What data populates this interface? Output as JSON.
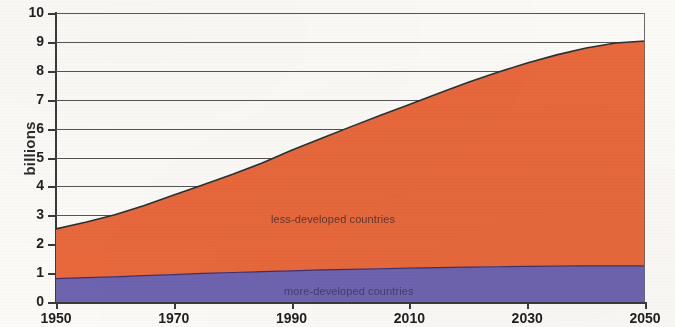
{
  "chart_data": {
    "type": "area",
    "stacked": true,
    "title": "",
    "xlabel": "",
    "ylabel": "billions",
    "xlim": [
      1950,
      2050
    ],
    "ylim": [
      0,
      10
    ],
    "grid": true,
    "legend_position": "in-plot-annotations",
    "x_tick_labels": [
      "1950",
      "1970",
      "1990",
      "2010",
      "2030",
      "2050"
    ],
    "x_ticks": [
      1950,
      1970,
      1990,
      2010,
      2030,
      2050
    ],
    "y_tick_labels": [
      "0",
      "1",
      "2",
      "3",
      "4",
      "5",
      "6",
      "7",
      "8",
      "9",
      "10"
    ],
    "y_ticks": [
      0,
      1,
      2,
      3,
      4,
      5,
      6,
      7,
      8,
      9,
      10
    ],
    "x": [
      1950,
      1955,
      1960,
      1965,
      1970,
      1975,
      1980,
      1985,
      1990,
      1995,
      2000,
      2005,
      2010,
      2015,
      2020,
      2025,
      2030,
      2035,
      2040,
      2045,
      2050
    ],
    "series": [
      {
        "name": "more-developed countries",
        "color": "#6E63AF",
        "values": [
          0.81,
          0.84,
          0.87,
          0.91,
          0.95,
          0.99,
          1.02,
          1.05,
          1.08,
          1.11,
          1.13,
          1.15,
          1.17,
          1.19,
          1.21,
          1.22,
          1.23,
          1.24,
          1.25,
          1.25,
          1.25
        ]
      },
      {
        "name": "less-developed countries",
        "color": "#E8683C",
        "values": [
          1.72,
          1.92,
          2.15,
          2.43,
          2.75,
          3.07,
          3.4,
          3.76,
          4.17,
          4.55,
          4.93,
          5.3,
          5.66,
          6.03,
          6.39,
          6.73,
          7.04,
          7.31,
          7.54,
          7.71,
          7.78
        ]
      }
    ],
    "totals": [
      2.53,
      2.76,
      3.02,
      3.34,
      3.7,
      4.06,
      4.42,
      4.81,
      5.25,
      5.66,
      6.06,
      6.45,
      6.83,
      7.22,
      7.6,
      7.95,
      8.27,
      8.55,
      8.79,
      8.96,
      9.03
    ]
  },
  "annotations": {
    "less_developed_label": "less-developed countries",
    "more_developed_label": "more-developed countries"
  },
  "colors": {
    "less_developed": "#E8683C",
    "more_developed": "#6E63AF",
    "axis": "#3a3a3a",
    "gridline": "#545454",
    "boundary_line": "#2f2f2f",
    "background": "#fbfaf7"
  }
}
